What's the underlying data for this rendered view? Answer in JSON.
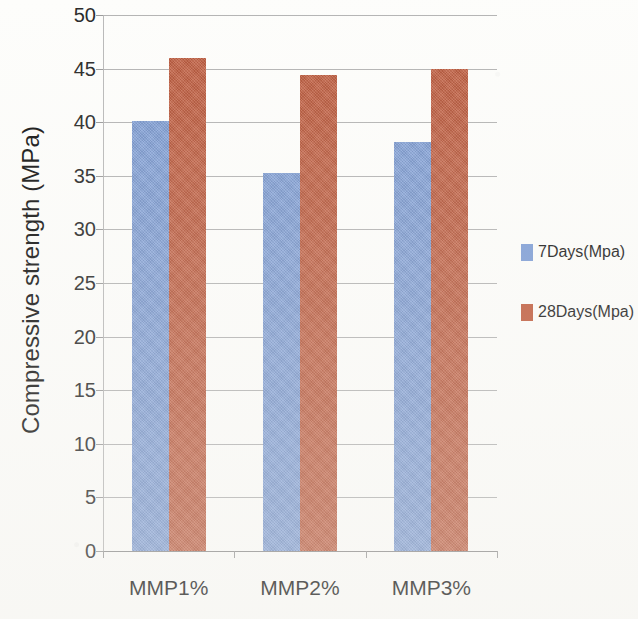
{
  "chart_data": {
    "type": "bar",
    "title": "",
    "subtitle": "",
    "xlabel": "",
    "ylabel": "Compressive strength (MPa)",
    "categories": [
      "MMP1%",
      "MMP2%",
      "MMP3%"
    ],
    "series": [
      {
        "name": "7Days(Mpa)",
        "color": "#7f9ed6",
        "values": [
          40.1,
          35.3,
          38.2
        ]
      },
      {
        "name": "28Days(Mpa)",
        "color": "#c05c3e",
        "values": [
          46.0,
          44.4,
          45.0
        ]
      }
    ],
    "ylim": [
      0,
      50
    ],
    "ytick_step": 5,
    "ytick_labels": [
      "0",
      "5",
      "10",
      "15",
      "20",
      "25",
      "30",
      "35",
      "40",
      "45",
      "50"
    ],
    "grid": "horizontal",
    "legend_position": "right",
    "annotations": []
  },
  "legend": {
    "entries": [
      {
        "label": "7Days(Mpa)"
      },
      {
        "label": "28Days(Mpa)"
      }
    ]
  },
  "axes": {
    "y_title": "Compressive strength (MPa)",
    "x_title": ""
  },
  "icons": {
    "legend_swatch_a": "blue-square-icon",
    "legend_swatch_b": "orange-square-icon"
  }
}
